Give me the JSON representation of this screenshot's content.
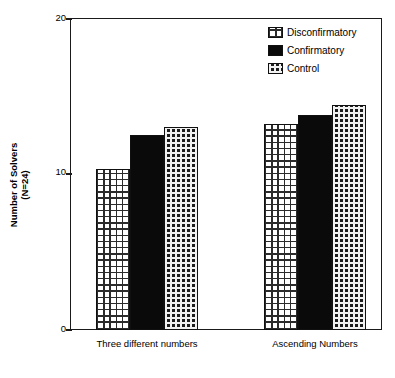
{
  "chart_data": {
    "type": "bar",
    "title": "",
    "subtitle": "",
    "xlabel": "",
    "ylabel": "Number of Solvers (N=24)",
    "ylabel_line1": "Number of Solvers",
    "ylabel_line2": "(N=24)",
    "ylim": [
      0,
      20
    ],
    "yticks": [
      0,
      10,
      20
    ],
    "ytick_labels": [
      "0",
      "10",
      "20"
    ],
    "grid": false,
    "legend_position": "top-right",
    "categories": [
      "Three different numbers",
      "Ascending Numbers"
    ],
    "series": [
      {
        "name": "Disconfirmatory",
        "values": [
          10.3,
          13.2
        ],
        "pattern": "light-grid-hatch",
        "color": "#ffffff",
        "line_color": "#101010"
      },
      {
        "name": "Confirmatory",
        "values": [
          12.5,
          13.8
        ],
        "pattern": "solid-black",
        "color": "#0a0a0a",
        "line_color": "#101010"
      },
      {
        "name": "Control",
        "values": [
          13.0,
          14.4
        ],
        "pattern": "dense-dark-checker",
        "color": "#1c1c1c",
        "line_color": "#101010"
      }
    ]
  },
  "axis": {
    "tick_20": "20",
    "tick_10": "10",
    "tick_0": "0"
  },
  "legend": {
    "items": [
      {
        "label": "Disconfirmatory",
        "swatch": "disconfirmatory-swatch"
      },
      {
        "label": "Confirmatory",
        "swatch": "confirmatory-swatch"
      },
      {
        "label": "Control",
        "swatch": "control-swatch"
      }
    ]
  },
  "xaxis": {
    "labels": [
      "Three different numbers",
      "Ascending Numbers"
    ]
  }
}
